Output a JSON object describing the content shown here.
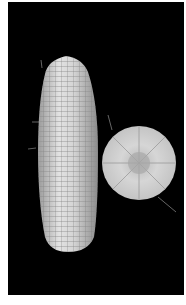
{
  "image": {
    "description": "Photograph of a white corn ear beside a cross-section slice on a black background",
    "background_color": "#000000",
    "border_color": "#ffffff",
    "subjects": [
      {
        "name": "corn-ear",
        "color": "#d8d8d8"
      },
      {
        "name": "corn-cross-section",
        "color": "#d0d0d0"
      }
    ]
  }
}
